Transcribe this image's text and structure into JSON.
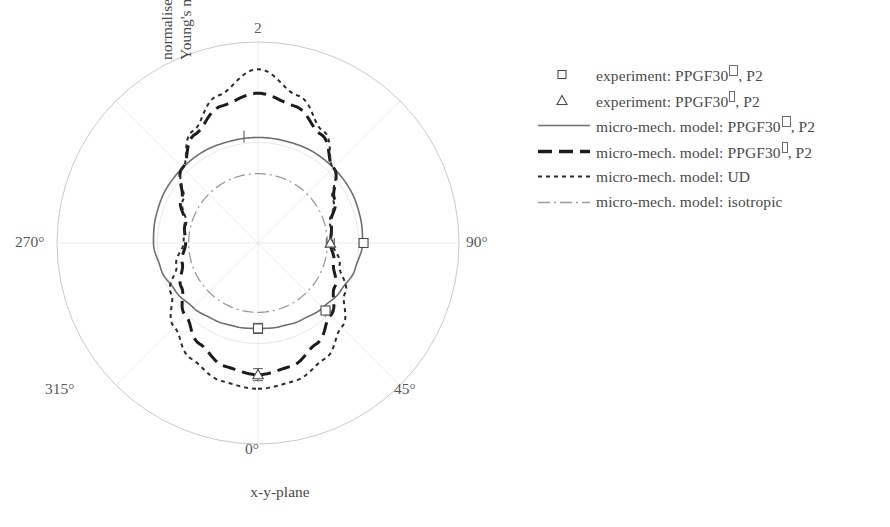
{
  "figure": {
    "axis_label_y_line1": "normalised",
    "axis_label_y_line2": "Young's modulus / –",
    "axis_label_x": "x-y-plane"
  },
  "polar": {
    "angle_ticks": [
      {
        "label": "2",
        "kind": "radial"
      },
      {
        "label": "90°",
        "angle_deg": 90
      },
      {
        "label": "45°",
        "angle_deg": 45
      },
      {
        "label": "0°",
        "angle_deg": 0
      },
      {
        "label": "315°",
        "angle_deg": 315
      },
      {
        "label": "270°",
        "angle_deg": 270
      }
    ],
    "radial_ticks": [
      "1",
      "2"
    ],
    "r_max": 2
  },
  "legend": {
    "items": [
      {
        "key": "square-marker",
        "label_prefix": "experiment: PPGF30",
        "sup": "perpendicular",
        "label_suffix": ", P2",
        "style": "marker-square",
        "color": "#4a4a4a"
      },
      {
        "key": "triangle-marker",
        "label_prefix": "experiment: PPGF30",
        "sup": "parallel",
        "label_suffix": ", P2",
        "style": "marker-triangle",
        "color": "#4a4a4a"
      },
      {
        "key": "solid-line",
        "label_prefix": "micro-mech. model: PPGF30",
        "sup": "perpendicular",
        "label_suffix": ", P2",
        "style": "line-solid",
        "color": "#6e6e6e"
      },
      {
        "key": "dashed-line",
        "label_prefix": "micro-mech. model: PPGF30",
        "sup": "parallel",
        "label_suffix": ", P2",
        "style": "line-dashed",
        "color": "#1c1c1c"
      },
      {
        "key": "dotted-line",
        "label_prefix": "micro-mech. model: UD",
        "sup": "",
        "label_suffix": "",
        "style": "line-dotted",
        "color": "#2b2b2b"
      },
      {
        "key": "dashdot-line",
        "label_prefix": "micro-mech. model: isotropic",
        "sup": "",
        "label_suffix": "",
        "style": "line-dashdot",
        "color": "#9a9a9a"
      }
    ]
  },
  "chart_data": {
    "type": "line",
    "projection": "polar",
    "title": "",
    "xlabel": "x-y-plane",
    "ylabel": "normalised Young's modulus / –",
    "rlim": [
      0,
      2
    ],
    "rticks": [
      1,
      2
    ],
    "theta_ticks_deg": [
      0,
      45,
      90,
      135,
      180,
      225,
      270,
      315
    ],
    "theta_tick_labels": [
      "0°",
      "45°",
      "90°",
      "135°",
      "180°",
      "225°",
      "270°",
      "315°"
    ],
    "theta_zero_location": "S",
    "theta_direction": "counterclockwise",
    "grid": true,
    "legend_position": "right",
    "theta_deg": [
      0,
      15,
      30,
      45,
      60,
      75,
      90,
      105,
      120,
      135,
      150,
      165,
      180,
      195,
      210,
      225,
      240,
      255,
      270,
      285,
      300,
      315,
      330,
      345,
      360
    ],
    "series": [
      {
        "name": "micro-mech. model: PPGF30 perpendicular, P2",
        "style": "solid",
        "color": "#6e6e6e",
        "r": [
          0.85,
          0.86,
          0.88,
          0.91,
          0.95,
          1.0,
          1.04,
          1.05,
          1.06,
          1.06,
          1.06,
          1.05,
          1.05,
          1.05,
          1.06,
          1.06,
          1.06,
          1.05,
          1.04,
          1.0,
          0.95,
          0.91,
          0.88,
          0.86,
          0.85
        ]
      },
      {
        "name": "micro-mech. model: PPGF30 parallel, P2",
        "style": "dashed",
        "color": "#1c1c1c",
        "r": [
          1.31,
          1.27,
          1.16,
          1.02,
          0.88,
          0.78,
          0.72,
          0.75,
          0.88,
          1.06,
          1.25,
          1.41,
          1.49,
          1.41,
          1.25,
          1.06,
          0.88,
          0.75,
          0.72,
          0.78,
          0.88,
          1.02,
          1.16,
          1.27,
          1.31
        ]
      },
      {
        "name": "micro-mech. model: UD",
        "style": "dotted",
        "color": "#2b2b2b",
        "r": [
          1.45,
          1.42,
          1.33,
          1.18,
          1.0,
          0.84,
          0.74,
          0.74,
          0.86,
          1.06,
          1.29,
          1.52,
          1.73,
          1.52,
          1.29,
          1.06,
          0.86,
          0.74,
          0.74,
          0.84,
          1.0,
          1.18,
          1.33,
          1.42,
          1.45
        ]
      },
      {
        "name": "micro-mech. model: isotropic",
        "style": "dashdot",
        "color": "#9a9a9a",
        "r": [
          0.69,
          0.69,
          0.69,
          0.69,
          0.69,
          0.69,
          0.69,
          0.69,
          0.69,
          0.69,
          0.69,
          0.69,
          0.69,
          0.69,
          0.69,
          0.69,
          0.69,
          0.69,
          0.69,
          0.69,
          0.69,
          0.69,
          0.69,
          0.69,
          0.69
        ]
      }
    ],
    "experiment_points": [
      {
        "name": "experiment: PPGF30 perpendicular, P2",
        "marker": "square",
        "theta_deg": 0,
        "r": 0.85,
        "yerr": 0.05
      },
      {
        "name": "experiment: PPGF30 perpendicular, P2",
        "marker": "square",
        "theta_deg": 45,
        "r": 0.95,
        "yerr": 0.04
      },
      {
        "name": "experiment: PPGF30 perpendicular, P2",
        "marker": "square",
        "theta_deg": 90,
        "r": 1.05,
        "yerr": 0.04
      },
      {
        "name": "experiment: PPGF30 parallel, P2",
        "marker": "triangle",
        "theta_deg": 0,
        "r": 1.31,
        "yerr": 0.06
      },
      {
        "name": "experiment: PPGF30 parallel, P2",
        "marker": "triangle",
        "theta_deg": 90,
        "r": 0.72,
        "yerr": 0.04
      }
    ]
  }
}
